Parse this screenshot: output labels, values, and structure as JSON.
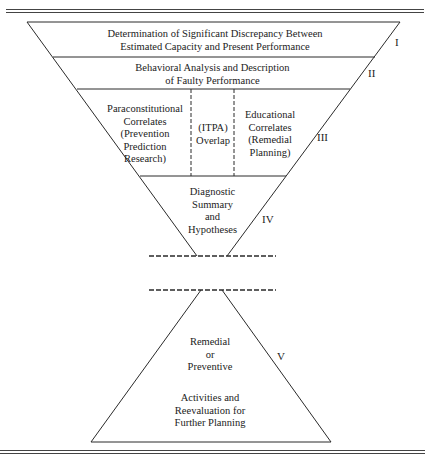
{
  "diagram": {
    "stages": [
      {
        "numeral": "I",
        "lines": [
          "Determination of Significant Discrepancy Between",
          "Estimated Capacity and Present Performance"
        ]
      },
      {
        "numeral": "II",
        "lines": [
          "Behavioral Analysis and Description",
          "of Faulty Performance"
        ]
      },
      {
        "numeral": "III",
        "left": [
          "Paraconstitutional",
          "Correlates",
          "(Prevention",
          "Prediction",
          "Research)"
        ],
        "center": [
          "(ITPA)",
          "Overlap"
        ],
        "right": [
          "Educational",
          "Correlates",
          "(Remedial",
          "Planning)"
        ]
      },
      {
        "numeral": "IV",
        "lines": [
          "Diagnostic",
          "Summary",
          "and",
          "Hypotheses"
        ]
      },
      {
        "numeral": "V",
        "upper": [
          "Remedial",
          "or",
          "Preventive"
        ],
        "lower": [
          "Activities and",
          "Reevaluation for",
          "Further Planning"
        ]
      }
    ],
    "colors": {
      "line": "#2a2a2a",
      "background": "#ffffff"
    }
  }
}
